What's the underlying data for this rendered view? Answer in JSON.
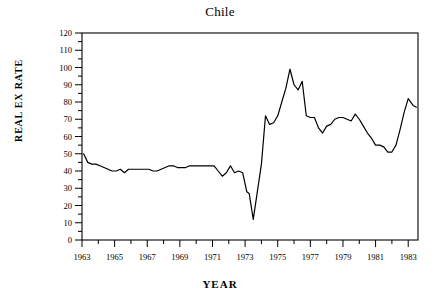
{
  "chart_data": {
    "type": "line",
    "title": "Chile",
    "xlabel": "YEAR",
    "ylabel": "REAL EX RATE",
    "grid": false,
    "legend": null,
    "xlim": [
      1963,
      1983.6
    ],
    "ylim": [
      0,
      120
    ],
    "y_ticks_major": [
      0,
      10,
      20,
      30,
      40,
      50,
      60,
      70,
      80,
      90,
      100,
      110,
      120
    ],
    "y_ticks_minor_step": 5,
    "x_ticks_major": [
      1963,
      1965,
      1967,
      1969,
      1971,
      1973,
      1975,
      1977,
      1979,
      1981,
      1983
    ],
    "x_ticks_minor": [
      1964,
      1966,
      1968,
      1970,
      1972,
      1974,
      1976,
      1978,
      1980,
      1982
    ],
    "line_color": "#000000",
    "series": [
      {
        "name": "REAL EX RATE",
        "x": [
          1963.1,
          1963.35,
          1963.6,
          1963.85,
          1964.1,
          1964.35,
          1964.6,
          1964.85,
          1965.1,
          1965.35,
          1965.6,
          1965.85,
          1966.1,
          1966.35,
          1966.6,
          1966.85,
          1967.1,
          1967.35,
          1967.6,
          1967.85,
          1968.1,
          1968.35,
          1968.6,
          1968.85,
          1969.1,
          1969.35,
          1969.6,
          1969.85,
          1970.1,
          1970.35,
          1970.6,
          1970.85,
          1971.1,
          1971.35,
          1971.6,
          1971.85,
          1972.1,
          1972.35,
          1972.6,
          1972.85,
          1973.1,
          1973.25,
          1973.5,
          1974.0,
          1974.25,
          1974.5,
          1974.75,
          1975.0,
          1975.25,
          1975.5,
          1975.75,
          1976.0,
          1976.25,
          1976.5,
          1976.75,
          1977.0,
          1977.25,
          1977.5,
          1977.75,
          1978.0,
          1978.25,
          1978.5,
          1978.75,
          1979.0,
          1979.25,
          1979.5,
          1979.75,
          1980.0,
          1980.25,
          1980.5,
          1980.75,
          1981.0,
          1981.25,
          1981.5,
          1981.75,
          1982.0,
          1982.25,
          1982.5,
          1982.75,
          1983.0,
          1983.3,
          1983.5
        ],
        "y": [
          50,
          45,
          44,
          44,
          43,
          42,
          41,
          40,
          40,
          41,
          39,
          41,
          41,
          41,
          41,
          41,
          41,
          40,
          40,
          41,
          42,
          43,
          43,
          42,
          42,
          42,
          43,
          43,
          43,
          43,
          43,
          43,
          43,
          40,
          37,
          39,
          43,
          39,
          40,
          39,
          28,
          27,
          12,
          44,
          72,
          67,
          68,
          72,
          80,
          88,
          99,
          90,
          87,
          92,
          72,
          71,
          71,
          65,
          62,
          66,
          67,
          70,
          71,
          71,
          70,
          69,
          73,
          70,
          66,
          62,
          59,
          55,
          55,
          54,
          51,
          51,
          55,
          64,
          74,
          82,
          78,
          77
        ]
      }
    ]
  }
}
